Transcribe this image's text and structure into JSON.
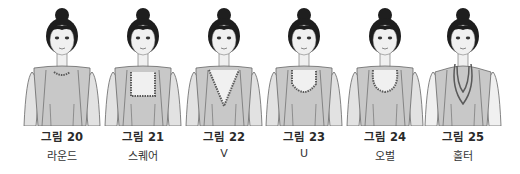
{
  "figures": [
    {
      "number": "그림 20",
      "label": "라운드",
      "neckline": "round",
      "center_x": 62
    },
    {
      "number": "그림 21",
      "label": "스퀘어",
      "neckline": "square",
      "center_x": 143
    },
    {
      "number": "그림 22",
      "label": "V",
      "neckline": "v",
      "center_x": 224
    },
    {
      "number": "그림 23",
      "label": "U",
      "neckline": "u",
      "center_x": 304
    },
    {
      "number": "그림 24",
      "label": "오벌",
      "neckline": "oval",
      "center_x": 385
    },
    {
      "number": "그림 25",
      "label": "홀터",
      "neckline": "halter",
      "center_x": 463
    }
  ],
  "colors": {
    "hair": "#1e1e1e",
    "skin": "#f0f0f0",
    "garment": "#c8c8c8",
    "sleeve": "#e2e2e2",
    "line": "#666666",
    "trim": "#5a5a5a"
  }
}
